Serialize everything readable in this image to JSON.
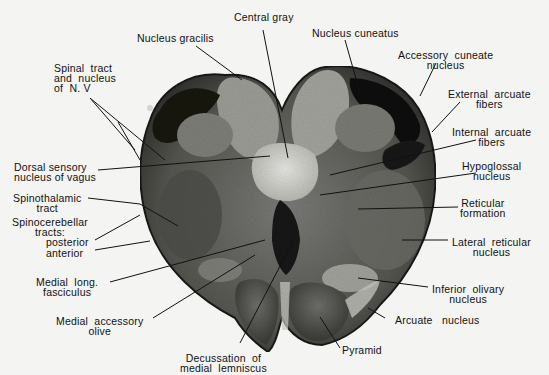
{
  "figure": {
    "labels": {
      "central_gray": "Central gray",
      "nucleus_gracilis": "Nucleus gracilis",
      "nucleus_cuneatus": "Nucleus cuneatus",
      "accessory_cuneate": "Accessory  cuneate\nnucleus",
      "spinal_tract_v": "Spinal  tract\nand  nucleus\nof  N. V",
      "external_arcuate": "External  arcuate\nfibers",
      "internal_arcuate": "Internal  arcuate\nfibers",
      "dorsal_sensory_vagus": "Dorsal sensory\nnucleus of vagus",
      "hypoglossal": "Hypoglossal\nnucleus",
      "spinothalamic": "Spinothalamic\ntract",
      "reticular_formation": "Reticular\nformation",
      "spinocerebellar": "Spinocerebellar\ntracts:",
      "posterior": "posterior",
      "anterior": "anterior",
      "lateral_reticular": "Lateral  reticular\nnucleus",
      "medial_long_fasciculus": "Medial  long.\nfasciculus",
      "inferior_olivary": "Inferior  olivary\nnucleus",
      "medial_accessory_olive": "Medial  accessory\nolive",
      "arcuate_nucleus": "Arcuate   nucleus",
      "pyramid": "Pyramid",
      "decussation": "Decussation  of\nmedial  lemniscus"
    },
    "colors": {
      "background": "#f4f4f2",
      "tissue_dark": "#1a1a1a",
      "tissue_mid": "#5a5a5a",
      "tissue_light": "#9a9a9a",
      "central_gray": "#d8d8d4",
      "leader_line": "#111111"
    }
  }
}
